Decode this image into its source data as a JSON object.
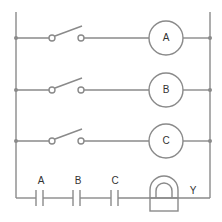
{
  "diagram": {
    "type": "ladder-relay-circuit",
    "rungs": [
      {
        "switch": "normally-open switch",
        "coil_label": "A"
      },
      {
        "switch": "normally-open switch",
        "coil_label": "B"
      },
      {
        "switch": "normally-open switch",
        "coil_label": "C"
      }
    ],
    "bottom_rung": {
      "contacts": [
        {
          "label": "A"
        },
        {
          "label": "B"
        },
        {
          "label": "C"
        }
      ],
      "output_label": "Y"
    },
    "colors": {
      "wire": "#8a8a8a",
      "text": "#333333",
      "background": "#ffffff"
    }
  }
}
